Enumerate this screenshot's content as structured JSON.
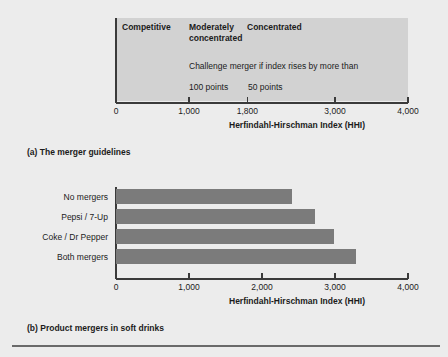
{
  "figure": {
    "background_color": "#ececec",
    "bar_color": "#7b7b7b",
    "zone_box_color": "#d2d2d2"
  },
  "panel_a": {
    "caption": "(a) The merger guidelines",
    "axis_title": "Herfindahl-Hirschman Index (HHI)",
    "zones": [
      {
        "label": "Competitive",
        "value": 0
      },
      {
        "label": "Moderately\nconcentrated",
        "value": 1000
      },
      {
        "label": "Concentrated",
        "value": 1800
      }
    ],
    "note": "Challenge merger if index rises by more than",
    "thresholds": [
      {
        "label": "100 points",
        "zone": "Moderately concentrated"
      },
      {
        "label": "50 points",
        "zone": "Concentrated"
      }
    ],
    "ticks": [
      {
        "label": "0",
        "value": 0
      },
      {
        "label": "1,000",
        "value": 1000
      },
      {
        "label": "1,800",
        "value": 1800
      },
      {
        "label": "3,000",
        "value": 3000
      },
      {
        "label": "4,000",
        "value": 4000
      }
    ]
  },
  "panel_b": {
    "caption": "(b) Product mergers in soft drinks",
    "axis_title": "Herfindahl-Hirschman Index (HHI)",
    "ticks": [
      {
        "label": "0",
        "value": 0
      },
      {
        "label": "1,000",
        "value": 1000
      },
      {
        "label": "2,000",
        "value": 2000
      },
      {
        "label": "3,000",
        "value": 3000
      },
      {
        "label": "4,000",
        "value": 4000
      }
    ]
  },
  "chart_data": [
    {
      "type": "bar",
      "orientation": "horizontal",
      "title": "(a) The merger guidelines",
      "xlabel": "Herfindahl-Hirschman Index (HHI)",
      "ylabel": "",
      "xlim": [
        0,
        4000
      ],
      "xticks": [
        0,
        1000,
        1800,
        3000,
        4000
      ],
      "xticklabels": [
        "0",
        "1,000",
        "1,800",
        "3,000",
        "4,000"
      ],
      "grid": false,
      "legend": "none",
      "annotations": [
        {
          "text": "Competitive",
          "x_range": [
            0,
            1000
          ]
        },
        {
          "text": "Moderately concentrated",
          "x_range": [
            1000,
            1800
          ]
        },
        {
          "text": "Concentrated",
          "x_range": [
            1800,
            4000
          ]
        },
        {
          "text": "Challenge merger if index rises by more than",
          "x": 1000
        },
        {
          "text": "100 points",
          "x": 1000
        },
        {
          "text": "50 points",
          "x": 1800
        }
      ]
    },
    {
      "type": "bar",
      "orientation": "horizontal",
      "title": "(b) Product mergers in soft drinks",
      "xlabel": "Herfindahl-Hirschman Index (HHI)",
      "ylabel": "",
      "xlim": [
        0,
        4000
      ],
      "xticks": [
        0,
        1000,
        2000,
        3000,
        4000
      ],
      "xticklabels": [
        "0",
        "1,000",
        "2,000",
        "3,000",
        "4,000"
      ],
      "grid": false,
      "legend": "none",
      "categories": [
        "No mergers",
        "Pepsi / 7-Up",
        "Coke / Dr Pepper",
        "Both mergers"
      ],
      "values": [
        2410,
        2730,
        2990,
        3290
      ],
      "bar_color": "#7b7b7b"
    }
  ]
}
